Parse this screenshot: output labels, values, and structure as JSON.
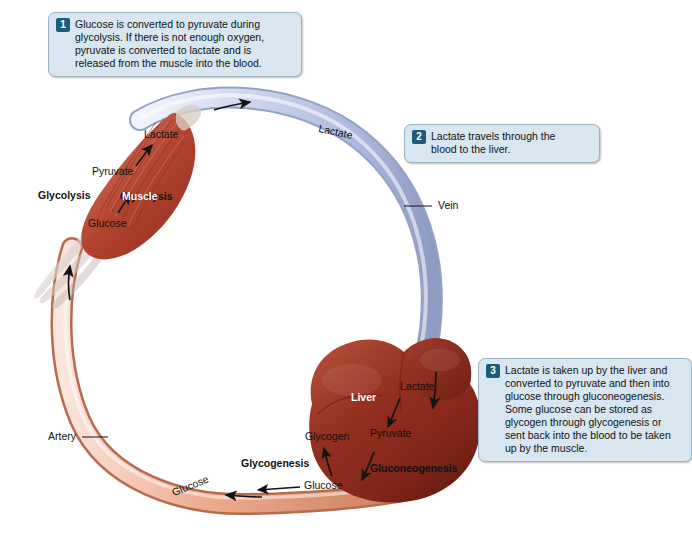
{
  "diagram": {
    "callouts": [
      {
        "num": "1",
        "text": "Glucose is converted to pyruvate during glycolysis. If there is not enough oxygen, pyruvate is converted to lactate and is released from the muscle into the blood."
      },
      {
        "num": "2",
        "text": "Lactate travels through the blood to the liver."
      },
      {
        "num": "3",
        "text": "Lactate is taken up by the liver and converted to pyruvate and then into glucose through gluconeogenesis. Some glucose can be stored as glycogen through glycogenesis or sent back into the blood to be taken up by the muscle."
      }
    ],
    "labels": {
      "muscle": "Muscle",
      "glycolysis": "Glycolysis",
      "muscle_lactate": "Lactate",
      "muscle_pyruvate": "Pyruvate",
      "muscle_glucose": "Glucose",
      "vessel_lactate": "Lactate",
      "vein": "Vein",
      "artery": "Artery",
      "vessel_glucose": "Glucose",
      "liver": "Liver",
      "liver_lactate": "Lactate",
      "liver_pyruvate": "Pyruvate",
      "liver_glycogen": "Glycogen",
      "liver_glucose": "Glucose",
      "glycogenesis": "Glycogenesis",
      "gluconeogenesis": "Gluconeogenesis"
    },
    "colors": {
      "callout_bg": "#d7e6ef",
      "callout_border": "#9bb4c2",
      "callout_number_bg": "#1d5b7a",
      "vein_fill": "#c9d4ea",
      "vein_edge": "#8e9cc4",
      "artery_fill": "#e8a489",
      "artery_edge": "#c4apparent",
      "muscle_fill": "#b9503f",
      "liver_fill": "#8e2f24",
      "arrow": "#1a1a1a"
    }
  }
}
